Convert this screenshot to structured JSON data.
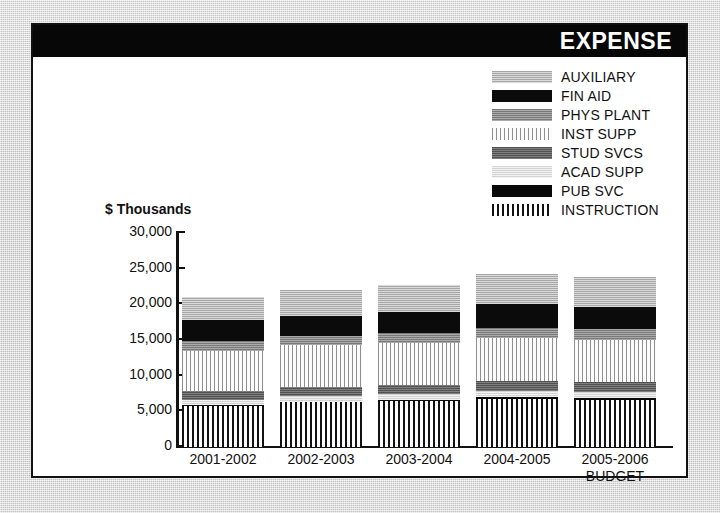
{
  "header": {
    "title": "EXPENSE"
  },
  "axis": {
    "ylabel": "$ Thousands",
    "yticks": [
      "30,000",
      "25,000",
      "20,000",
      "15,000",
      "10,000",
      "5,000",
      "0"
    ]
  },
  "legend": [
    {
      "label": "AUXILIARY",
      "pattern": "p-auxiliary"
    },
    {
      "label": "FIN AID",
      "pattern": "p-finaid"
    },
    {
      "label": "PHYS PLANT",
      "pattern": "p-physplant"
    },
    {
      "label": "INST SUPP",
      "pattern": "p-instsupp"
    },
    {
      "label": "STUD SVCS",
      "pattern": "p-studsvcs"
    },
    {
      "label": "ACAD SUPP",
      "pattern": "p-acadsupp"
    },
    {
      "label": "PUB SVC",
      "pattern": "p-pubsvc"
    },
    {
      "label": "INSTRUCTION",
      "pattern": "p-instruction"
    }
  ],
  "chart_data": {
    "type": "bar",
    "subtype": "stacked",
    "title": "EXPENSE",
    "xlabel": "",
    "ylabel": "$ Thousands",
    "ylim": [
      0,
      30000
    ],
    "ytick_step": 5000,
    "grid": false,
    "legend_position": "top-right",
    "categories": [
      "2001-2002",
      "2002-2003",
      "2003-2004",
      "2004-2005",
      "2005-2006"
    ],
    "category_sublabels": [
      "",
      "",
      "",
      "",
      "BUDGET"
    ],
    "stack_order_bottom_to_top": [
      "INSTRUCTION",
      "PUB SVC",
      "ACAD SUPP",
      "STUD SVCS",
      "INST SUPP",
      "PHYS PLANT",
      "FIN AID",
      "AUXILIARY"
    ],
    "series": [
      {
        "name": "INSTRUCTION",
        "pattern": "p-instruction",
        "values": [
          5750,
          6250,
          6500,
          6750,
          6625
        ]
      },
      {
        "name": "PUB SVC",
        "pattern": "p-pubsvc",
        "values": [
          125,
          125,
          125,
          250,
          250
        ]
      },
      {
        "name": "ACAD SUPP",
        "pattern": "p-acadsupp",
        "values": [
          750,
          750,
          875,
          875,
          875
        ]
      },
      {
        "name": "STUD SVCS",
        "pattern": "p-studsvcs",
        "values": [
          1250,
          1250,
          1250,
          1375,
          1375
        ]
      },
      {
        "name": "INST SUPP",
        "pattern": "p-instsupp",
        "values": [
          5625,
          5875,
          5875,
          6000,
          5875
        ]
      },
      {
        "name": "PHYS PLANT",
        "pattern": "p-physplant",
        "values": [
          1375,
          1250,
          1375,
          1500,
          1500
        ]
      },
      {
        "name": "FIN AID",
        "pattern": "p-finaid",
        "values": [
          2875,
          2875,
          3000,
          3250,
          3125
        ]
      },
      {
        "name": "AUXILIARY",
        "pattern": "p-auxiliary",
        "values": [
          3250,
          3625,
          3750,
          4250,
          4250
        ]
      }
    ],
    "totals": [
      21000,
      22000,
      22750,
      24250,
      23875
    ]
  }
}
